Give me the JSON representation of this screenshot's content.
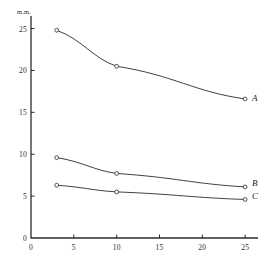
{
  "chart_data": {
    "type": "line",
    "title": "",
    "subtitle": "",
    "xlabel": "",
    "ylabel": "m.m.",
    "ylabel_position": "above-y-axis-top",
    "x": [
      3,
      10,
      25
    ],
    "xlim": [
      0,
      26.5
    ],
    "ylim": [
      0,
      26.5
    ],
    "xticks": [
      0,
      5,
      10,
      15,
      20,
      25
    ],
    "xtick_labels": [
      "0",
      "5",
      "10",
      "15",
      "20",
      "25"
    ],
    "yticks": [
      5,
      10,
      15,
      20,
      25
    ],
    "ytick_labels": [
      "5",
      "10",
      "15",
      "20",
      "25"
    ],
    "grid": false,
    "legend": "inline-right-end-labels",
    "marker": "open-circle",
    "line_color": "#2b2b2b",
    "series": [
      {
        "name": "A",
        "label": "A",
        "values": [
          24.8,
          20.5,
          16.6
        ],
        "label_x": 25.8,
        "label_y": 16.6
      },
      {
        "name": "B",
        "label": "B",
        "values": [
          9.6,
          7.7,
          6.1
        ],
        "label_x": 25.8,
        "label_y": 6.5
      },
      {
        "name": "C",
        "label": "C",
        "values": [
          6.3,
          5.5,
          4.6
        ],
        "label_x": 25.8,
        "label_y": 4.9
      }
    ]
  },
  "figure": {
    "background_color": "#ffffff",
    "axis_color": "#2b2b2b"
  }
}
